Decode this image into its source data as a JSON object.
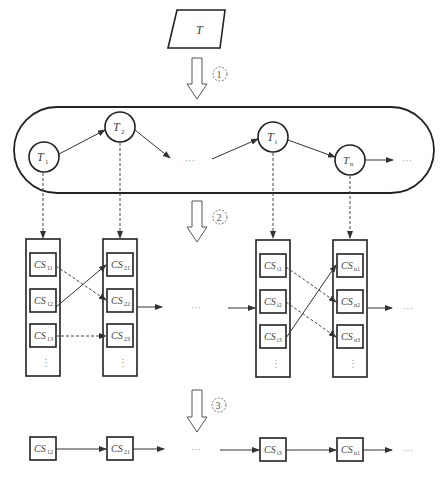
{
  "input_node": {
    "label": "T"
  },
  "steps": [
    {
      "label": "1",
      "arrow_y": 58
    },
    {
      "label": "2",
      "arrow_y": 200
    },
    {
      "label": "3",
      "arrow_y": 390
    }
  ],
  "task_chain": {
    "nodes": [
      {
        "label": "T",
        "sub": "1",
        "cx": 44,
        "cy": 157
      },
      {
        "label": "T",
        "sub": "2",
        "cx": 120,
        "cy": 127
      },
      {
        "label": "T",
        "sub": "i",
        "cx": 273,
        "cy": 137
      },
      {
        "label": "T",
        "sub": "n",
        "cx": 350,
        "cy": 160
      }
    ],
    "ellipsis": "···"
  },
  "candidate_columns": [
    {
      "x": 26,
      "cells": [
        {
          "label": "CS",
          "sub": "11"
        },
        {
          "label": "CS",
          "sub": "12"
        },
        {
          "label": "CS",
          "sub": "13"
        }
      ],
      "more": "⋮"
    },
    {
      "x": 103,
      "cells": [
        {
          "label": "CS",
          "sub": "21"
        },
        {
          "label": "CS",
          "sub": "22"
        },
        {
          "label": "CS",
          "sub": "23"
        }
      ],
      "more": "⋮"
    },
    {
      "x": 256,
      "cells": [
        {
          "label": "CS",
          "sub": "i1"
        },
        {
          "label": "CS",
          "sub": "i2"
        },
        {
          "label": "CS",
          "sub": "i3"
        }
      ],
      "more": "⋮"
    },
    {
      "x": 333,
      "cells": [
        {
          "label": "CS",
          "sub": "n1"
        },
        {
          "label": "CS",
          "sub": "n2"
        },
        {
          "label": "CS",
          "sub": "n3"
        }
      ],
      "more": "⋮"
    }
  ],
  "result_chain": {
    "nodes": [
      {
        "label": "CS",
        "sub": "12",
        "x": 30
      },
      {
        "label": "CS",
        "sub": "21",
        "x": 107
      },
      {
        "label": "CS",
        "sub": "i3",
        "x": 260
      },
      {
        "label": "CS",
        "sub": "n1",
        "x": 337
      }
    ],
    "ellipsis": "···"
  },
  "ellipsis": "···"
}
